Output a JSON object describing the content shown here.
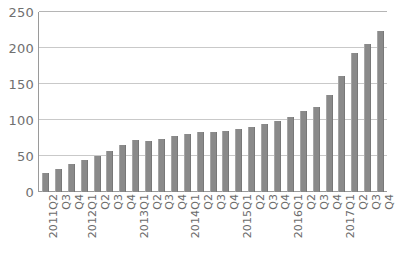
{
  "chart_data": {
    "type": "bar",
    "title": "",
    "subtitle": "",
    "xlabel": "",
    "ylabel": "",
    "ylim": [
      0,
      250
    ],
    "yticks": [
      0,
      50,
      100,
      150,
      200,
      250
    ],
    "grid": true,
    "legend": false,
    "legend_position": "none",
    "bar_color": "#8a8a8a",
    "gridline_color": "#c9c9c9",
    "axis_color": "#9a9a9a",
    "categories": [
      "2011Q2",
      "Q3",
      "Q4",
      "2012Q1",
      "Q2",
      "Q3",
      "Q4",
      "2013Q1",
      "Q2",
      "Q3",
      "Q4",
      "2014Q1",
      "Q2",
      "Q3",
      "Q4",
      "2015Q1",
      "Q2",
      "Q3",
      "Q4",
      "2016Q1",
      "Q2",
      "Q3",
      "Q4",
      "2017Q1",
      "Q2",
      "Q3",
      "Q4"
    ],
    "values": [
      27,
      32,
      39,
      45,
      50,
      57,
      65,
      72,
      71,
      74,
      78,
      81,
      83,
      83,
      85,
      88,
      90,
      95,
      99,
      104,
      112,
      118,
      135,
      161,
      193,
      205,
      224
    ]
  }
}
